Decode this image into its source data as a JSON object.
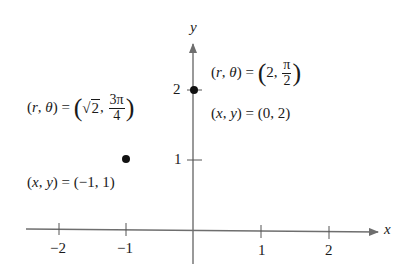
{
  "diagram": {
    "axes": {
      "x_label": "x",
      "y_label": "y",
      "x_ticks": [
        {
          "value": -2,
          "label": "−2"
        },
        {
          "value": -1,
          "label": "−1"
        },
        {
          "value": 1,
          "label": "1"
        },
        {
          "value": 2,
          "label": "2"
        }
      ],
      "y_ticks": [
        {
          "value": 1,
          "label": "1"
        },
        {
          "value": 2,
          "label": "2"
        }
      ],
      "axis_color": "#6e6e6e"
    },
    "points": [
      {
        "name": "point-a",
        "x": 0,
        "y": 2,
        "polar_lhs": "(r, θ) = ",
        "polar_r": "2",
        "polar_theta_num": "π",
        "polar_theta_den": "2",
        "rect_label": "(x, y) = (0, 2)"
      },
      {
        "name": "point-b",
        "x": -1,
        "y": 1,
        "polar_lhs": "(r, θ) = ",
        "polar_r": "2",
        "polar_r_is_sqrt": true,
        "polar_theta_num": "3π",
        "polar_theta_den": "4",
        "rect_label": "(x, y) = (−1, 1)"
      }
    ],
    "point_color": "#111111"
  }
}
